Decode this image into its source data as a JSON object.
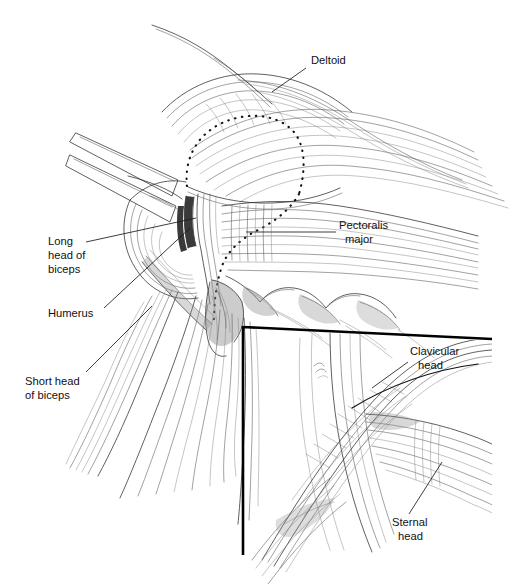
{
  "figure": {
    "background_color": "#ffffff",
    "ink_color": "#2b2b2b",
    "width": 526,
    "height": 584
  },
  "labels": [
    {
      "id": "deltoid",
      "text": "Deltoid",
      "lines": [
        "Deltoid"
      ],
      "x": 311,
      "y": 61,
      "anchor": "start",
      "leader": "M 306 68 L 272 92"
    },
    {
      "id": "pectoralis-major",
      "text": "Pectoralis major",
      "lines": [
        "Pectoralis",
        "major"
      ],
      "x": 339,
      "y": 226,
      "anchor": "start",
      "leader": "M 336 232 L 246 232"
    },
    {
      "id": "long-head-of-biceps",
      "text": "Long head of biceps",
      "lines": [
        "Long",
        "head of",
        "biceps"
      ],
      "x": 48,
      "y": 242,
      "anchor": "start",
      "leader": "M 86 242 L 196 218"
    },
    {
      "id": "humerus",
      "text": "Humerus",
      "lines": [
        "Humerus"
      ],
      "x": 48,
      "y": 314,
      "anchor": "start",
      "leader": "M 104 308 L 190 228"
    },
    {
      "id": "short-head-of-biceps",
      "text": "Short head of biceps",
      "lines": [
        "Short head",
        "of biceps"
      ],
      "x": 25,
      "y": 382,
      "anchor": "start",
      "leader": "M 86 372 L 152 306"
    },
    {
      "id": "clavicular-head",
      "text": "Clavicular head",
      "lines": [
        "Clavicular",
        "head"
      ],
      "x": 410,
      "y": 352,
      "anchor": "start",
      "leader": "M 408 362 L 372 388"
    },
    {
      "id": "sternal-head",
      "text": "Sternal head",
      "lines": [
        "Sternal",
        "head"
      ],
      "x": 392,
      "y": 523,
      "anchor": "start",
      "leader": "M 409 514 L 442 462"
    }
  ],
  "inset": {
    "id": "inset-detail",
    "description": "Detail of clavicular and sternal heads of pectoralis major",
    "frame_path": "M 243 555 L 243 327 L 492 339",
    "border_color": "#000000"
  },
  "annotations": {
    "dotted_outline": {
      "id": "deltoid-resection-outline",
      "description": "Dotted outline over deltoid and down to pectoralis insertion",
      "style": "dotted"
    }
  }
}
